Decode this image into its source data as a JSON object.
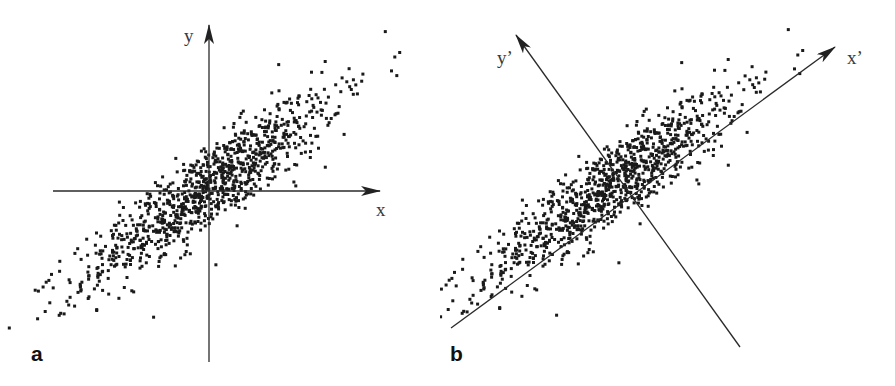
{
  "figure": {
    "panels": [
      {
        "id": "a",
        "label": "a",
        "axis_labels": {
          "x": "x",
          "y": "y"
        },
        "description": "Correlated 2D scatter with standard x/y axes"
      },
      {
        "id": "b",
        "label": "b",
        "axis_labels": {
          "x": "x’",
          "y": "y’"
        },
        "description": "Same scatter with rotated principal axes x' and y'"
      }
    ],
    "colors": {
      "points": "#1a1a1a",
      "axes": "#2a2a2a",
      "background": "#ffffff"
    }
  },
  "chart_data": [
    {
      "type": "scatter",
      "title": "",
      "panel": "a",
      "xlabel": "x",
      "ylabel": "y",
      "grid": false,
      "n_points": 1000,
      "distribution": {
        "center": [
          0,
          0
        ],
        "principal_angle_deg": 36,
        "std_major": 1.0,
        "std_minor": 0.22
      },
      "x_range": [
        -2.4,
        2.4
      ],
      "y_range": [
        -2.0,
        2.0
      ]
    },
    {
      "type": "scatter",
      "title": "",
      "panel": "b",
      "xlabel": "x’",
      "ylabel": "y’",
      "grid": false,
      "n_points": 1000,
      "distribution": {
        "center": [
          0,
          0
        ],
        "principal_angle_deg": 36,
        "std_major": 1.0,
        "std_minor": 0.22
      },
      "rotated_axes_angle_deg": 36
    }
  ]
}
